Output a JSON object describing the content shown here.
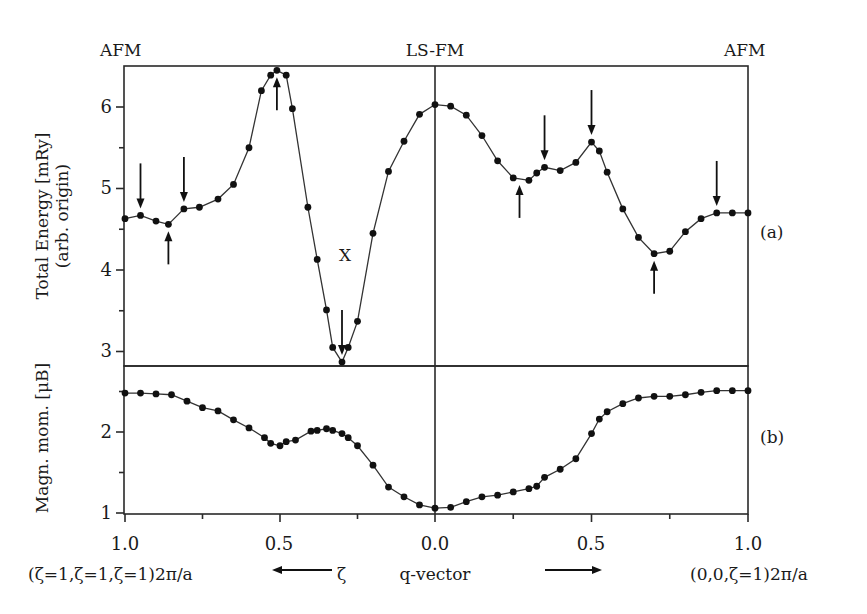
{
  "chart_data": [
    {
      "panel": "(a)",
      "type": "line",
      "title": "",
      "ylabel": "Total Energy [mRy] (arb. origin)",
      "xlabel": "q-vector",
      "ylim": [
        2.8,
        6.5
      ],
      "yticks": [
        3,
        4,
        5,
        6
      ],
      "grid": false,
      "x_note": "x < 0 : along (ζ,ζ,ζ)2π/a with ζ = |x| (1.0 at left edge); x > 0 : along (0,0,ζ)2π/a",
      "series": [
        {
          "name": "Total Energy",
          "x": [
            -1.0,
            -0.95,
            -0.9,
            -0.86,
            -0.81,
            -0.76,
            -0.7,
            -0.65,
            -0.6,
            -0.56,
            -0.53,
            -0.51,
            -0.48,
            -0.46,
            -0.41,
            -0.38,
            -0.35,
            -0.33,
            -0.3,
            -0.28,
            -0.25,
            -0.2,
            -0.15,
            -0.1,
            -0.05,
            0.0,
            0.05,
            0.1,
            0.15,
            0.2,
            0.25,
            0.3,
            0.325,
            0.35,
            0.4,
            0.45,
            0.5,
            0.525,
            0.55,
            0.6,
            0.65,
            0.7,
            0.75,
            0.8,
            0.85,
            0.9,
            0.95,
            1.0
          ],
          "values": [
            4.63,
            4.67,
            4.6,
            4.56,
            4.75,
            4.77,
            4.87,
            5.05,
            5.5,
            6.2,
            6.39,
            6.45,
            6.39,
            5.98,
            4.77,
            4.13,
            3.51,
            3.05,
            2.87,
            3.05,
            3.37,
            4.45,
            5.21,
            5.58,
            5.91,
            6.03,
            6.01,
            5.9,
            5.65,
            5.34,
            5.13,
            5.1,
            5.19,
            5.26,
            5.22,
            5.32,
            5.57,
            5.46,
            5.2,
            4.75,
            4.4,
            4.2,
            4.23,
            4.47,
            4.63,
            4.7,
            4.7,
            4.7
          ]
        }
      ],
      "annotations": [
        {
          "text": "AFM",
          "at": "x=-1.0, top"
        },
        {
          "text": "LS-FM",
          "at": "x=0.0, top"
        },
        {
          "text": "AFM",
          "at": "x=1.0, top"
        },
        {
          "text": "X",
          "at": "x=-0.30 near minimum"
        },
        {
          "text": "down arrow",
          "x": -0.95
        },
        {
          "text": "up arrow",
          "x": -0.86
        },
        {
          "text": "down arrow",
          "x": -0.81
        },
        {
          "text": "up arrow",
          "x": -0.51
        },
        {
          "text": "down arrow",
          "x": -0.3
        },
        {
          "text": "up arrow",
          "x": 0.27
        },
        {
          "text": "down arrow",
          "x": 0.35
        },
        {
          "text": "down arrow",
          "x": 0.5
        },
        {
          "text": "up arrow",
          "x": 0.7
        },
        {
          "text": "down arrow",
          "x": 0.9
        }
      ]
    },
    {
      "panel": "(b)",
      "type": "line",
      "title": "",
      "ylabel": "Magn. mom. [μB]",
      "xlabel": "q-vector",
      "ylim": [
        1.0,
        2.8
      ],
      "yticks": [
        1,
        2
      ],
      "grid": false,
      "series": [
        {
          "name": "Magnetic moment",
          "x": [
            -1.0,
            -0.95,
            -0.9,
            -0.85,
            -0.8,
            -0.75,
            -0.7,
            -0.65,
            -0.6,
            -0.55,
            -0.53,
            -0.5,
            -0.48,
            -0.45,
            -0.4,
            -0.38,
            -0.35,
            -0.33,
            -0.3,
            -0.28,
            -0.25,
            -0.2,
            -0.15,
            -0.1,
            -0.05,
            0.0,
            0.05,
            0.1,
            0.15,
            0.2,
            0.25,
            0.3,
            0.325,
            0.35,
            0.4,
            0.45,
            0.5,
            0.525,
            0.55,
            0.6,
            0.65,
            0.7,
            0.75,
            0.8,
            0.85,
            0.9,
            0.95,
            1.0
          ],
          "values": [
            2.48,
            2.48,
            2.47,
            2.46,
            2.38,
            2.3,
            2.26,
            2.15,
            2.05,
            1.93,
            1.86,
            1.83,
            1.88,
            1.9,
            2.01,
            2.02,
            2.04,
            2.02,
            1.98,
            1.93,
            1.83,
            1.59,
            1.32,
            1.2,
            1.1,
            1.06,
            1.07,
            1.14,
            1.2,
            1.22,
            1.26,
            1.3,
            1.33,
            1.44,
            1.54,
            1.67,
            1.98,
            2.16,
            2.25,
            2.35,
            2.42,
            2.44,
            2.44,
            2.46,
            2.49,
            2.51,
            2.51,
            2.51
          ]
        }
      ]
    }
  ],
  "labels": {
    "top_left": "AFM",
    "top_center": "LS-FM",
    "top_right": "AFM",
    "panel_a": "(a)",
    "panel_b": "(b)",
    "minimum_marker": "X",
    "ylabel_a_line1": "Total Energy [mRy]",
    "ylabel_a_line2": "(arb. origin)",
    "ylabel_b": "Magn. mom. [μB]",
    "yticks_a": [
      "6",
      "5",
      "4",
      "3"
    ],
    "yticks_b": [
      "2",
      "1"
    ],
    "xticks": [
      "1.0",
      "0.5",
      "0.0",
      "0.5",
      "1.0"
    ],
    "x_left_direction": "(ζ=1,ζ=1,ζ=1)2π/a",
    "x_zeta": "ζ",
    "x_center": "q-vector",
    "x_right_direction": "(0,0,ζ=1)2π/a"
  }
}
